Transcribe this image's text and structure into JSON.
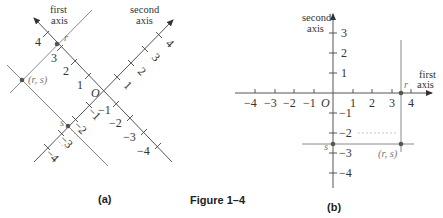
{
  "figure": {
    "caption": "Figure 1–4",
    "panel_a": {
      "label": "(a)",
      "first_axis_label": [
        "first",
        "axis"
      ],
      "second_axis_label": [
        "second",
        "axis"
      ],
      "origin": "O",
      "first_axis_ticks": [
        "4",
        "3",
        "2",
        "1",
        "−1",
        "−2",
        "−3",
        "−4"
      ],
      "second_axis_ticks": [
        "4",
        "3",
        "2",
        "1",
        "−1",
        "−2",
        "−3",
        "−4"
      ],
      "r_label": "r",
      "s_label": "s",
      "point_label": "(r, s)"
    },
    "panel_b": {
      "label": "(b)",
      "first_axis_label": [
        "first",
        "axis"
      ],
      "second_axis_label": [
        "second",
        "axis"
      ],
      "origin": "O",
      "x_ticks": [
        "−4",
        "−3",
        "−2",
        "−1",
        "1",
        "2",
        "3",
        "4"
      ],
      "y_ticks": [
        "3",
        "2",
        "1",
        "−1",
        "−2",
        "−3",
        "−4"
      ],
      "r_label": "r",
      "s_label": "s",
      "point_label": "(r, s)"
    }
  }
}
